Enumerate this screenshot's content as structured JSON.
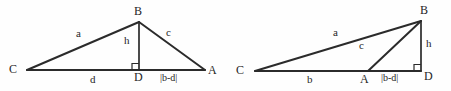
{
  "figure": {
    "background_color": "#fefefe",
    "line_color": "#2b2b2b",
    "text_color": "#262626",
    "diagrams": [
      {
        "id": "acute-triangle",
        "name": "acute-triangle-foot-inside",
        "description": "Triangle ABC with altitude BD falling inside segment CA",
        "vertices": [
          {
            "name": "C",
            "label": "C",
            "x": 27,
            "y": 70
          },
          {
            "name": "B",
            "label": "B",
            "x": 139,
            "y": 22
          },
          {
            "name": "A",
            "label": "A",
            "x": 205,
            "y": 70
          },
          {
            "name": "D",
            "label": "D",
            "x": 139,
            "y": 70
          }
        ],
        "vertex_labels": [
          {
            "text": "C",
            "x": 9,
            "y": 63
          },
          {
            "text": "B",
            "x": 134,
            "y": 5
          },
          {
            "text": "A",
            "x": 208,
            "y": 64
          },
          {
            "text": "D",
            "x": 134,
            "y": 71
          }
        ],
        "side_labels": [
          {
            "text": "a",
            "x": 76,
            "y": 28
          },
          {
            "text": "c",
            "x": 166,
            "y": 27
          },
          {
            "text": "h",
            "x": 124,
            "y": 35
          }
        ],
        "segment_labels": [
          {
            "text": "d",
            "x": 90,
            "y": 74
          },
          {
            "text": "|b-d|",
            "x": 160,
            "y": 73
          }
        ],
        "right_angle_at": "D"
      },
      {
        "id": "obtuse-triangle",
        "name": "obtuse-triangle-foot-outside",
        "description": "Triangle ABC with altitude BD falling outside segment CA",
        "vertices": [
          {
            "name": "C",
            "label": "C",
            "x": 255,
            "y": 71
          },
          {
            "name": "B",
            "label": "B",
            "x": 421,
            "y": 21
          },
          {
            "name": "A",
            "label": "A",
            "x": 368,
            "y": 71
          },
          {
            "name": "D",
            "label": "D",
            "x": 421,
            "y": 71
          }
        ],
        "vertex_labels": [
          {
            "text": "C",
            "x": 236,
            "y": 64
          },
          {
            "text": "B",
            "x": 420,
            "y": 4
          },
          {
            "text": "A",
            "x": 360,
            "y": 73
          },
          {
            "text": "D",
            "x": 424,
            "y": 70
          }
        ],
        "side_labels": [
          {
            "text": "a",
            "x": 333,
            "y": 27
          },
          {
            "text": "c",
            "x": 359,
            "y": 40
          },
          {
            "text": "h",
            "x": 426,
            "y": 38
          }
        ],
        "segment_labels": [
          {
            "text": "b",
            "x": 307,
            "y": 74
          },
          {
            "text": "|b-d|",
            "x": 381,
            "y": 73
          }
        ],
        "right_angle_at": "D"
      }
    ]
  }
}
